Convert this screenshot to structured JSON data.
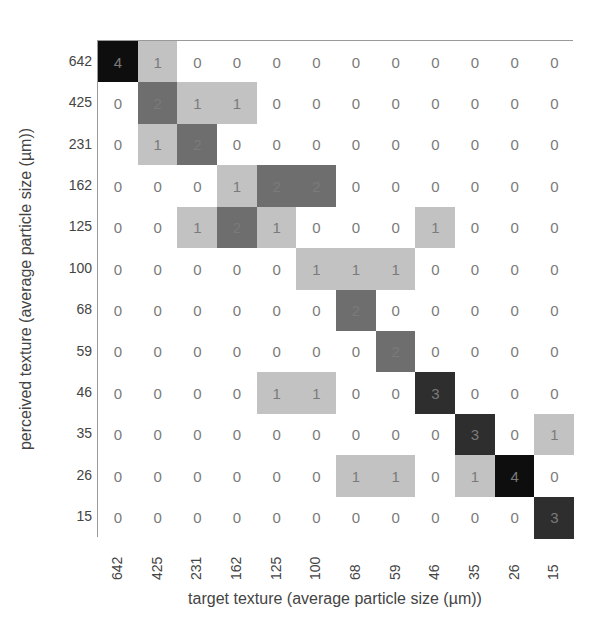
{
  "chart_data": {
    "type": "heatmap",
    "title": "",
    "xlabel": "target texture (average particle size (µm))",
    "ylabel": "perceived texture (average particle size (µm))",
    "x_categories": [
      "642",
      "425",
      "231",
      "162",
      "125",
      "100",
      "68",
      "59",
      "46",
      "35",
      "26",
      "15"
    ],
    "y_categories": [
      "642",
      "425",
      "231",
      "162",
      "125",
      "100",
      "68",
      "59",
      "46",
      "35",
      "26",
      "15"
    ],
    "matrix": [
      [
        4,
        1,
        0,
        0,
        0,
        0,
        0,
        0,
        0,
        0,
        0,
        0
      ],
      [
        0,
        2,
        1,
        1,
        0,
        0,
        0,
        0,
        0,
        0,
        0,
        0
      ],
      [
        0,
        1,
        2,
        0,
        0,
        0,
        0,
        0,
        0,
        0,
        0,
        0
      ],
      [
        0,
        0,
        0,
        1,
        2,
        2,
        0,
        0,
        0,
        0,
        0,
        0
      ],
      [
        0,
        0,
        1,
        2,
        1,
        0,
        0,
        0,
        1,
        0,
        0,
        0
      ],
      [
        0,
        0,
        0,
        0,
        0,
        1,
        1,
        1,
        0,
        0,
        0,
        0
      ],
      [
        0,
        0,
        0,
        0,
        0,
        0,
        2,
        0,
        0,
        0,
        0,
        0
      ],
      [
        0,
        0,
        0,
        0,
        0,
        0,
        0,
        2,
        0,
        0,
        0,
        0
      ],
      [
        0,
        0,
        0,
        0,
        1,
        1,
        0,
        0,
        3,
        0,
        0,
        0
      ],
      [
        0,
        0,
        0,
        0,
        0,
        0,
        0,
        0,
        0,
        3,
        0,
        1
      ],
      [
        0,
        0,
        0,
        0,
        0,
        0,
        1,
        1,
        0,
        1,
        4,
        0
      ],
      [
        0,
        0,
        0,
        0,
        0,
        0,
        0,
        0,
        0,
        0,
        0,
        3
      ]
    ],
    "value_range": [
      0,
      4
    ],
    "colormap": {
      "0": "#ffffff",
      "1": "#c2c2c2",
      "2": "#6e6e6e",
      "3": "#2e2e2e",
      "4": "#0e0e0e"
    },
    "text_color": "#7a7a7a",
    "grid": false,
    "legend": "none"
  }
}
